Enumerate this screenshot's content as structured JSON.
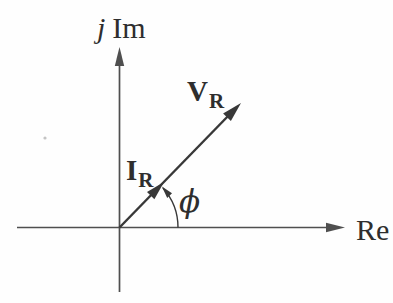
{
  "diagram": {
    "axes": {
      "imaginary": {
        "prefix": "j",
        "label": "Im"
      },
      "real": {
        "label": "Re"
      }
    },
    "vectors": {
      "voltage": {
        "symbol": "V",
        "subscript": "R"
      },
      "current": {
        "symbol": "I",
        "subscript": "R"
      }
    },
    "angle": {
      "symbol": "ϕ"
    },
    "colors": {
      "ink": "#383838",
      "axis": "#4f4f4f",
      "background": "#fefefe",
      "speck": "#c4c4c4"
    }
  }
}
